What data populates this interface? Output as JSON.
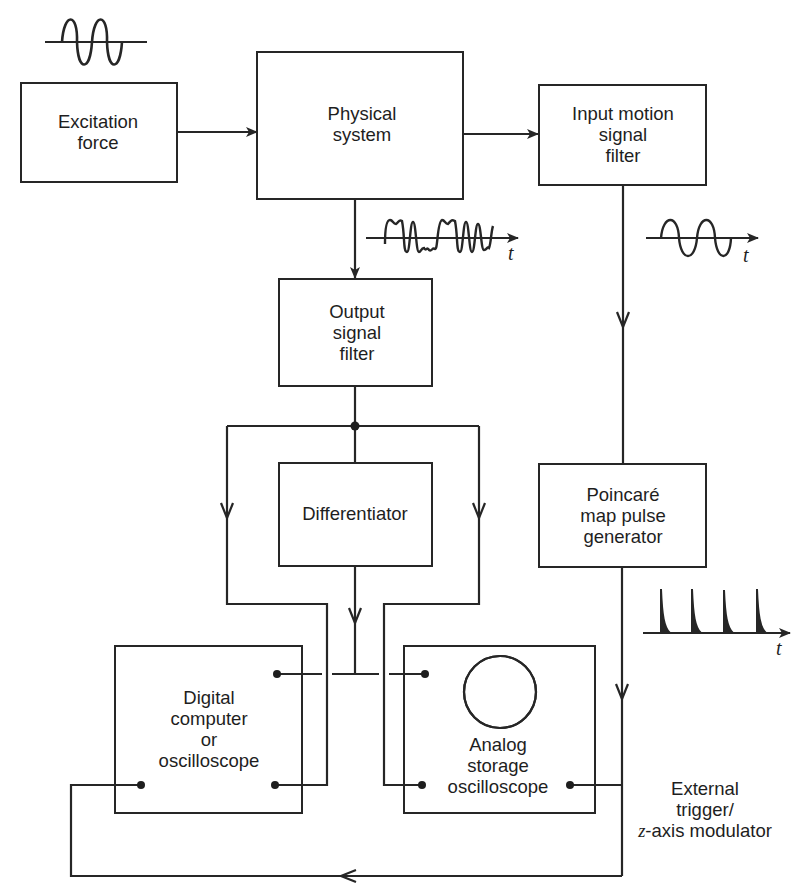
{
  "diagram": {
    "type": "block-diagram",
    "title": "",
    "colors": {
      "line": "#262626",
      "text": "#1e1e1e",
      "background": "#ffffff"
    },
    "blocks": {
      "excitation": {
        "lines": [
          "Excitation",
          "force"
        ]
      },
      "physical": {
        "lines": [
          "Physical",
          "system"
        ]
      },
      "input_filter": {
        "lines": [
          "Input motion",
          "signal",
          "filter"
        ]
      },
      "output_filter": {
        "lines": [
          "Output",
          "signal",
          "filter"
        ]
      },
      "differentiator": {
        "lines": [
          "Differentiator"
        ]
      },
      "poincare": {
        "lines": [
          "Poincaré",
          "map pulse",
          "generator"
        ]
      },
      "digital": {
        "lines": [
          "Digital",
          "computer",
          "or",
          "oscilloscope"
        ]
      },
      "analog": {
        "lines": [
          "Analog",
          "storage",
          "oscilloscope"
        ]
      }
    },
    "annotations": {
      "external_trigger": {
        "line1": "External",
        "line2": "trigger/",
        "line3_var": "z",
        "line3_rest": "-axis modulator"
      },
      "time_axis_label": "t"
    },
    "waveforms": [
      {
        "name": "excitation-sine",
        "kind": "sine",
        "cycles": 2
      },
      {
        "name": "physical-output-chaotic",
        "kind": "irregular",
        "axis_label": "t"
      },
      {
        "name": "input-motion-sine",
        "kind": "sine",
        "cycles": 2,
        "axis_label": "t"
      },
      {
        "name": "poincare-pulse-train",
        "kind": "pulses",
        "count": 4,
        "axis_label": "t"
      }
    ],
    "connections": [
      {
        "from": "Excitation force",
        "to": "Physical system"
      },
      {
        "from": "Physical system",
        "to": "Input motion signal filter"
      },
      {
        "from": "Physical system",
        "to": "Output signal filter"
      },
      {
        "from": "Output signal filter",
        "to": "Differentiator"
      },
      {
        "from": "Output signal filter",
        "to": "Digital computer or oscilloscope"
      },
      {
        "from": "Output signal filter",
        "to": "Analog storage oscilloscope"
      },
      {
        "from": "Differentiator",
        "to": "Digital computer or oscilloscope"
      },
      {
        "from": "Differentiator",
        "to": "Analog storage oscilloscope"
      },
      {
        "from": "Input motion signal filter",
        "to": "Poincaré map pulse generator"
      },
      {
        "from": "Poincaré map pulse generator",
        "to": "Analog storage oscilloscope"
      },
      {
        "from": "Poincaré map pulse generator",
        "to": "Digital computer or oscilloscope"
      }
    ]
  }
}
